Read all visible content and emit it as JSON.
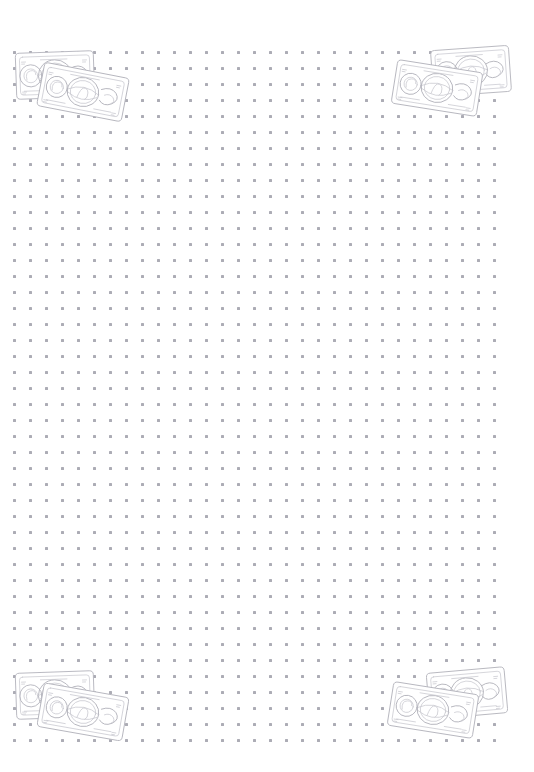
{
  "page": {
    "background_color": "#ffffff",
    "width": 534,
    "height": 772
  },
  "grid": {
    "name": "dot-grid",
    "dot_color": "#9e9ea8",
    "dot_size_px": 3,
    "spacing_px": 16,
    "origin_x": 14,
    "origin_y": 52,
    "columns": 31,
    "rows": 44
  },
  "illustrations": [
    {
      "id": "note-top-left",
      "label": "Pair of overlapping banknotes",
      "icon": "banknotes-icon",
      "position": "top-left",
      "x": 12,
      "y": 48,
      "rotation_back_deg": -2,
      "rotation_front_deg": 11,
      "stroke_color": "#b4b4bc"
    },
    {
      "id": "note-top-right",
      "label": "Pair of overlapping banknotes",
      "icon": "banknotes-icon",
      "position": "top-right",
      "x": 392,
      "y": 44,
      "rotation_back_deg": -4,
      "rotation_front_deg": 9,
      "stroke_color": "#b4b4bc"
    },
    {
      "id": "note-bottom-left",
      "label": "Pair of overlapping banknotes",
      "icon": "banknotes-icon",
      "position": "bottom-left",
      "x": 12,
      "y": 668,
      "rotation_back_deg": -2,
      "rotation_front_deg": 10,
      "stroke_color": "#b4b4bc"
    },
    {
      "id": "note-bottom-right",
      "label": "Pair of overlapping banknotes",
      "icon": "banknotes-icon",
      "position": "bottom-right",
      "x": 388,
      "y": 666,
      "rotation_back_deg": -5,
      "rotation_front_deg": 9,
      "stroke_color": "#b4b4bc"
    }
  ]
}
